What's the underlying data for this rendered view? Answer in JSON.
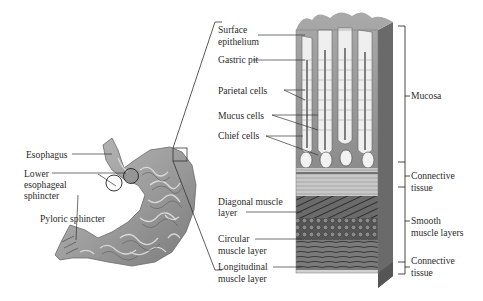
{
  "diagram": {
    "type": "anatomical-illustration",
    "stomach_labels": {
      "esophagus": "Esophagus",
      "lower_esophageal_sphincter_line1": "Lower",
      "lower_esophageal_sphincter_line2": "esophageal",
      "lower_esophageal_sphincter_line3": "sphincter",
      "pyloric_sphincter": "Pyloric sphincter"
    },
    "wall_labels_left": {
      "surface_epithelium_line1": "Surface",
      "surface_epithelium_line2": "epithelium",
      "gastric_pit": "Gastric pit",
      "parietal_cells": "Parietal cells",
      "mucus_cells": "Mucus cells",
      "chief_cells": "Chief cells",
      "diagonal_muscle_line1": "Diagonal muscle",
      "diagonal_muscle_line2": "layer",
      "circular_muscle_line1": "Circular",
      "circular_muscle_line2": "muscle layer",
      "longitudinal_muscle_line1": "Longitudinal",
      "longitudinal_muscle_line2": "muscle layer"
    },
    "wall_labels_right": {
      "mucosa": "Mucosa",
      "connective_tissue_1_line1": "Connective",
      "connective_tissue_1_line2": "tissue",
      "smooth_muscle_line1": "Smooth",
      "smooth_muscle_line2": "muscle layers",
      "connective_tissue_2_line1": "Connective",
      "connective_tissue_2_line2": "tissue"
    },
    "colors": {
      "tissue_light": "#d9d9d9",
      "tissue_mid": "#9a9a9a",
      "tissue_dark": "#4a4a4a",
      "line": "#333333"
    }
  }
}
